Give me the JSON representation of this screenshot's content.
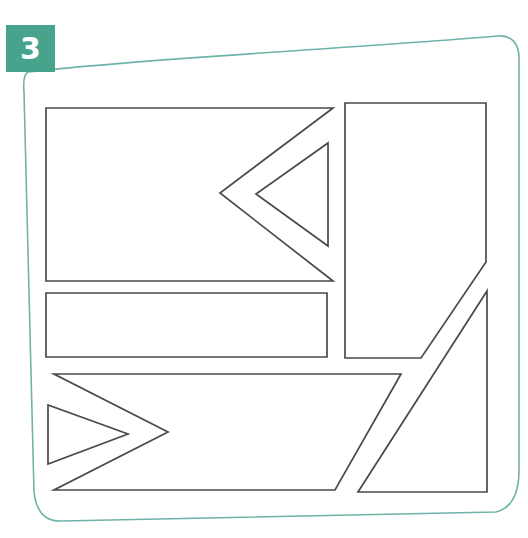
{
  "page": {
    "background_color": "#ffffff",
    "width": 528,
    "height": 538
  },
  "badge": {
    "label": "3",
    "background_color": "#48a38c",
    "text_color": "#ffffff",
    "shape": "square"
  },
  "frame": {
    "name": "hand-drawn-rounded-rectangle-border",
    "stroke_color": "#6fb3a8",
    "stroke_width": 1.6,
    "path": "M 28 72 C 150 58, 330 50, 498 36 C 512 35, 519 44, 519 58 L 519 470 C 519 492, 512 508, 496 512 L 62 521 C 44 522, 36 510, 34 492 L 24 92 C 23 80, 24 74, 28 72 Z"
  },
  "shapes": [
    {
      "id": "shape-1",
      "name": "notched-rectangle-with-inner-triangle",
      "description": "Rectangle with a V-shaped notch cut into its right side, pointing left",
      "fill": "#ffffff",
      "stroke": "#4a4a4a",
      "path": "M 46 108 L 333 108 L 220 193 L 333 281 L 46 281 Z"
    },
    {
      "id": "shape-1b",
      "name": "inner-triangle-left-pointing",
      "description": "Triangle nested inside the notch of shape 1, apex pointing left",
      "fill": "#ffffff",
      "stroke": "#4a4a4a",
      "path": "M 328 143 L 328 246 L 256 194 Z"
    },
    {
      "id": "shape-2",
      "name": "tall-pentagon-right",
      "description": "Tall vertical pentagon: rectangle with bottom-right corner cut off diagonally",
      "fill": "#ffffff",
      "stroke": "#4a4a4a",
      "path": "M 345 103 L 486 103 L 486 262 L 421 358 L 345 358 Z"
    },
    {
      "id": "shape-3",
      "name": "middle-horizontal-rectangle",
      "description": "Wide short rectangle below the first shape",
      "fill": "#ffffff",
      "stroke": "#4a4a4a",
      "path": "M 46 293 L 327 293 L 327 357 L 46 357 Z"
    },
    {
      "id": "shape-4",
      "name": "notched-parallelogram-with-inner-triangle",
      "description": "Slanted ribbon / parallelogram with a V-shaped notch cut into its left side, pointing right",
      "fill": "#ffffff",
      "stroke": "#4a4a4a",
      "path": "M 54 374 L 401 374 L 335 490 L 54 490 L 168 432 Z"
    },
    {
      "id": "shape-4b",
      "name": "inner-triangle-right-pointing",
      "description": "Triangle nested inside the notch of shape 4, apex pointing right",
      "fill": "#ffffff",
      "stroke": "#4a4a4a",
      "path": "M 48 405 L 48 464 L 128 434 Z"
    },
    {
      "id": "shape-5",
      "name": "bottom-right-right-triangle",
      "description": "Right triangle with vertical right leg, horizontal bottom leg and diagonal hypotenuse",
      "fill": "#ffffff",
      "stroke": "#4a4a4a",
      "path": "M 487 291 L 487 492 L 358 492 Z"
    }
  ]
}
